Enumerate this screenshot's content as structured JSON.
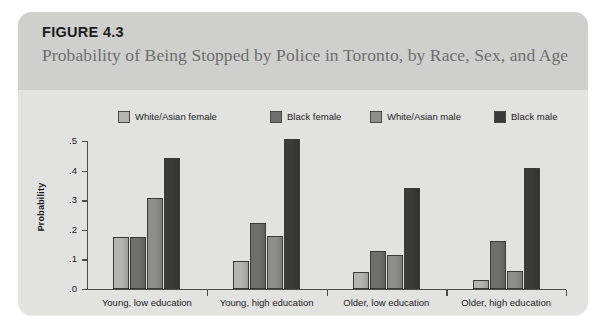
{
  "figure": {
    "number": "FIGURE 4.3",
    "title": "Probability of Being Stopped by Police in Toronto, by Race, Sex, and Age"
  },
  "colors": {
    "card_background": "#e2e2e1",
    "header_background": "#cfcfce",
    "axis": "#4d4d4d",
    "series": [
      "#b4b4b2",
      "#6e6e6d",
      "#8e8e8c",
      "#3a3a39"
    ]
  },
  "chart_data": {
    "type": "bar",
    "title": "Probability of Being Stopped by Police in Toronto, by Race, Sex, and Age",
    "xlabel": "",
    "ylabel": "Probability",
    "ylim": [
      0,
      0.5
    ],
    "yticks": [
      0.0,
      0.1,
      0.2,
      0.3,
      0.4,
      0.5
    ],
    "ytick_labels": [
      ".0",
      ".1",
      ".2",
      ".3",
      ".4",
      ".5"
    ],
    "grid": false,
    "legend_position": "top",
    "categories": [
      "Young, low education",
      "Young, high education",
      "Older, low education",
      "Older, high education"
    ],
    "series": [
      {
        "name": "White/Asian female",
        "color": "#b4b4b2",
        "values": [
          0.175,
          0.095,
          0.058,
          0.03
        ]
      },
      {
        "name": "Black female",
        "color": "#6e6e6d",
        "values": [
          0.177,
          0.222,
          0.13,
          0.163
        ]
      },
      {
        "name": "White/Asian male",
        "color": "#8e8e8c",
        "values": [
          0.307,
          0.178,
          0.115,
          0.06
        ]
      },
      {
        "name": "Black male",
        "color": "#3a3a39",
        "values": [
          0.443,
          0.508,
          0.34,
          0.41
        ]
      }
    ]
  }
}
